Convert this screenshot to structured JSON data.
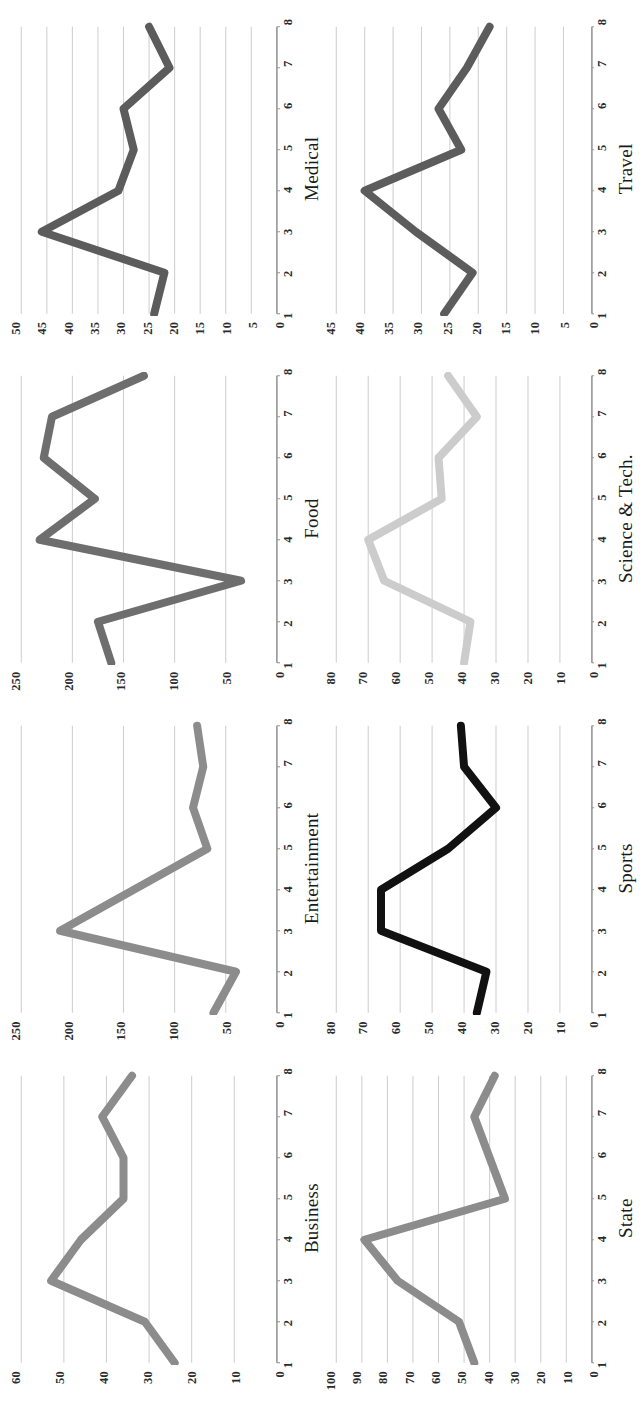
{
  "figure": {
    "rotation_degrees": -90,
    "grid": {
      "rows": 2,
      "cols": 4
    },
    "background_color": "#ffffff",
    "axis_color": "#9a9a9a",
    "gridline_color": "#cfcfcf",
    "tick_label_color": "#2b2b2b"
  },
  "chart_data": [
    {
      "type": "line",
      "title": "Business",
      "xlabel": "",
      "ylabel": "",
      "x": [
        1,
        2,
        3,
        4,
        5,
        6,
        7,
        8
      ],
      "categories": [
        "1",
        "2",
        "3",
        "4",
        "5",
        "6",
        "7",
        "8"
      ],
      "values": [
        24,
        31,
        53,
        46,
        36,
        36,
        41,
        34
      ],
      "series": [
        {
          "name": "Business",
          "values": [
            24,
            31,
            53,
            46,
            36,
            36,
            41,
            34
          ]
        }
      ],
      "xtick_labels": [
        "1",
        "2",
        "3",
        "4",
        "5",
        "6",
        "7",
        "8"
      ],
      "ytick_labels": [
        "0",
        "10",
        "20",
        "30",
        "40",
        "50",
        "60"
      ],
      "ytick_values": [
        0,
        10,
        20,
        30,
        40,
        50,
        60
      ],
      "ylim": [
        0,
        60
      ],
      "xlim": [
        1,
        8
      ],
      "grid": true,
      "legend": "none",
      "line_color": "#8c8c8c",
      "line_width": 8
    },
    {
      "type": "line",
      "title": "Entertainment",
      "xlabel": "",
      "ylabel": "",
      "x": [
        1,
        2,
        3,
        4,
        5,
        6,
        7,
        8
      ],
      "categories": [
        "1",
        "2",
        "3",
        "4",
        "5",
        "6",
        "7",
        "8"
      ],
      "values": [
        62,
        40,
        212,
        140,
        68,
        82,
        72,
        78
      ],
      "series": [
        {
          "name": "Entertainment",
          "values": [
            62,
            40,
            212,
            140,
            68,
            82,
            72,
            78
          ]
        }
      ],
      "xtick_labels": [
        "1",
        "2",
        "3",
        "4",
        "5",
        "6",
        "7",
        "8"
      ],
      "ytick_labels": [
        "0",
        "50",
        "100",
        "150",
        "200",
        "250"
      ],
      "ytick_values": [
        0,
        50,
        100,
        150,
        200,
        250
      ],
      "ylim": [
        0,
        250
      ],
      "xlim": [
        1,
        8
      ],
      "grid": true,
      "legend": "none",
      "line_color": "#8c8c8c",
      "line_width": 8
    },
    {
      "type": "line",
      "title": "Food",
      "xlabel": "",
      "ylabel": "",
      "x": [
        1,
        2,
        3,
        4,
        5,
        6,
        7,
        8
      ],
      "categories": [
        "1",
        "2",
        "3",
        "4",
        "5",
        "6",
        "7",
        "8"
      ],
      "values": [
        162,
        175,
        35,
        232,
        178,
        228,
        220,
        130
      ],
      "series": [
        {
          "name": "Food",
          "values": [
            162,
            175,
            35,
            232,
            178,
            228,
            220,
            130
          ]
        }
      ],
      "xtick_labels": [
        "1",
        "2",
        "3",
        "4",
        "5",
        "6",
        "7",
        "8"
      ],
      "ytick_labels": [
        "0",
        "50",
        "100",
        "150",
        "200",
        "250"
      ],
      "ytick_values": [
        0,
        50,
        100,
        150,
        200,
        250
      ],
      "ylim": [
        0,
        250
      ],
      "xlim": [
        1,
        8
      ],
      "grid": true,
      "legend": "none",
      "line_color": "#6e6e6e",
      "line_width": 8
    },
    {
      "type": "line",
      "title": "Medical",
      "xlabel": "",
      "ylabel": "",
      "x": [
        1,
        2,
        3,
        4,
        5,
        6,
        7,
        8
      ],
      "categories": [
        "1",
        "2",
        "3",
        "4",
        "5",
        "6",
        "7",
        "8"
      ],
      "values": [
        24,
        22,
        46,
        31,
        28,
        30,
        21,
        25
      ],
      "series": [
        {
          "name": "Medical",
          "values": [
            24,
            22,
            46,
            31,
            28,
            30,
            21,
            25
          ]
        }
      ],
      "xtick_labels": [
        "1",
        "2",
        "3",
        "4",
        "5",
        "6",
        "7",
        "8"
      ],
      "ytick_labels": [
        "0",
        "5",
        "10",
        "15",
        "20",
        "25",
        "30",
        "35",
        "40",
        "45",
        "50"
      ],
      "ytick_values": [
        0,
        5,
        10,
        15,
        20,
        25,
        30,
        35,
        40,
        45,
        50
      ],
      "ylim": [
        0,
        50
      ],
      "xlim": [
        1,
        8
      ],
      "grid": true,
      "legend": "none",
      "line_color": "#5c5c5c",
      "line_width": 8
    },
    {
      "type": "line",
      "title": "State",
      "xlabel": "",
      "ylabel": "",
      "x": [
        1,
        2,
        3,
        4,
        5,
        6,
        7,
        8
      ],
      "categories": [
        "1",
        "2",
        "3",
        "4",
        "5",
        "6",
        "7",
        "8"
      ],
      "values": [
        46,
        52,
        76,
        89,
        34,
        40,
        46,
        38
      ],
      "series": [
        {
          "name": "State",
          "values": [
            46,
            52,
            76,
            89,
            34,
            40,
            46,
            38
          ]
        }
      ],
      "xtick_labels": [
        "1",
        "2",
        "3",
        "4",
        "5",
        "6",
        "7",
        "8"
      ],
      "ytick_labels": [
        "0",
        "10",
        "20",
        "30",
        "40",
        "50",
        "60",
        "70",
        "80",
        "90",
        "100"
      ],
      "ytick_values": [
        0,
        10,
        20,
        30,
        40,
        50,
        60,
        70,
        80,
        90,
        100
      ],
      "ylim": [
        0,
        100
      ],
      "xlim": [
        1,
        8
      ],
      "grid": true,
      "legend": "none",
      "line_color": "#8c8c8c",
      "line_width": 8
    },
    {
      "type": "line",
      "title": "Sports",
      "xlabel": "",
      "ylabel": "",
      "x": [
        1,
        2,
        3,
        4,
        5,
        6,
        7,
        8
      ],
      "categories": [
        "1",
        "2",
        "3",
        "4",
        "5",
        "6",
        "7",
        "8"
      ],
      "values": [
        36,
        33,
        66,
        66,
        45,
        30,
        40,
        41
      ],
      "series": [
        {
          "name": "Sports",
          "values": [
            36,
            33,
            66,
            66,
            45,
            30,
            40,
            41
          ]
        }
      ],
      "xtick_labels": [
        "1",
        "2",
        "3",
        "4",
        "5",
        "6",
        "7",
        "8"
      ],
      "ytick_labels": [
        "0",
        "10",
        "20",
        "30",
        "40",
        "50",
        "60",
        "70",
        "80"
      ],
      "ytick_values": [
        0,
        10,
        20,
        30,
        40,
        50,
        60,
        70,
        80
      ],
      "ylim": [
        0,
        80
      ],
      "xlim": [
        1,
        8
      ],
      "grid": true,
      "legend": "none",
      "line_color": "#111111",
      "line_width": 8
    },
    {
      "type": "line",
      "title": "Science & Tech.",
      "xlabel": "",
      "ylabel": "",
      "x": [
        1,
        2,
        3,
        4,
        5,
        6,
        7,
        8
      ],
      "categories": [
        "1",
        "2",
        "3",
        "4",
        "5",
        "6",
        "7",
        "8"
      ],
      "values": [
        40,
        38,
        65,
        70,
        47,
        48,
        36,
        45
      ],
      "series": [
        {
          "name": "Science & Tech.",
          "values": [
            40,
            38,
            65,
            70,
            47,
            48,
            36,
            45
          ]
        }
      ],
      "xtick_labels": [
        "1",
        "2",
        "3",
        "4",
        "5",
        "6",
        "7",
        "8"
      ],
      "ytick_labels": [
        "0",
        "10",
        "20",
        "30",
        "40",
        "50",
        "60",
        "70",
        "80"
      ],
      "ytick_values": [
        0,
        10,
        20,
        30,
        40,
        50,
        60,
        70,
        80
      ],
      "ylim": [
        0,
        80
      ],
      "xlim": [
        1,
        8
      ],
      "grid": true,
      "legend": "none",
      "line_color": "#cccccc",
      "line_width": 8
    },
    {
      "type": "line",
      "title": "Travel",
      "xlabel": "",
      "ylabel": "",
      "x": [
        1,
        2,
        3,
        4,
        5,
        6,
        7,
        8
      ],
      "categories": [
        "1",
        "2",
        "3",
        "4",
        "5",
        "6",
        "7",
        "8"
      ],
      "values": [
        26,
        21,
        31,
        40,
        23,
        27,
        22,
        18
      ],
      "series": [
        {
          "name": "Travel",
          "values": [
            26,
            21,
            31,
            40,
            23,
            27,
            22,
            18
          ]
        }
      ],
      "xtick_labels": [
        "1",
        "2",
        "3",
        "4",
        "5",
        "6",
        "7",
        "8"
      ],
      "ytick_labels": [
        "0",
        "5",
        "10",
        "15",
        "20",
        "25",
        "30",
        "35",
        "40",
        "45"
      ],
      "ytick_values": [
        0,
        5,
        10,
        15,
        20,
        25,
        30,
        35,
        40,
        45
      ],
      "ylim": [
        0,
        45
      ],
      "xlim": [
        1,
        8
      ],
      "grid": true,
      "legend": "none",
      "line_color": "#5c5c5c",
      "line_width": 8
    }
  ]
}
